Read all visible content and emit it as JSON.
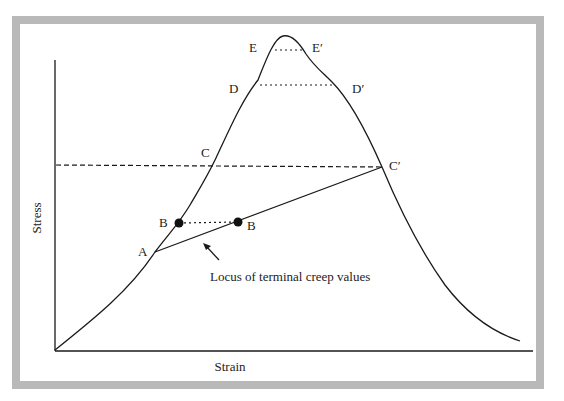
{
  "diagram": {
    "type": "stress-strain creep diagram",
    "axes": {
      "x_label": "Strain",
      "y_label": "Stress"
    },
    "points": {
      "A": "A",
      "B_left": "B",
      "B_right": "B",
      "C": "C",
      "C_prime": "C′",
      "D": "D",
      "D_prime": "D′",
      "E": "E",
      "E_prime": "E′"
    },
    "annotation": "Locus of terminal creep values",
    "colors": {
      "frame": "#b9b9b9",
      "line": "#1a1a1a",
      "background": "#ffffff"
    }
  }
}
